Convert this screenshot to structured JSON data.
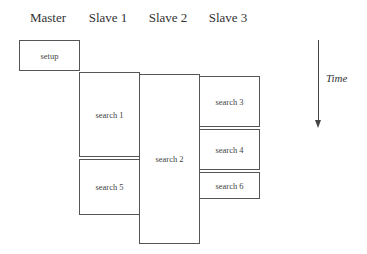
{
  "diagram": {
    "columns": [
      {
        "label": "Master",
        "center_x": 48
      },
      {
        "label": "Slave 1",
        "center_x": 108
      },
      {
        "label": "Slave 2",
        "center_x": 168
      },
      {
        "label": "Slave 3",
        "center_x": 228
      }
    ],
    "tasks": [
      {
        "label": "setup",
        "column": "Master"
      },
      {
        "label": "search 1",
        "column": "Slave 1"
      },
      {
        "label": "search 5",
        "column": "Slave 1"
      },
      {
        "label": "search 2",
        "column": "Slave 2"
      },
      {
        "label": "search 3",
        "column": "Slave 3"
      },
      {
        "label": "search 4",
        "column": "Slave 3"
      },
      {
        "label": "search 6",
        "column": "Slave 3"
      }
    ],
    "axis": {
      "label": "Time",
      "direction": "down"
    }
  }
}
